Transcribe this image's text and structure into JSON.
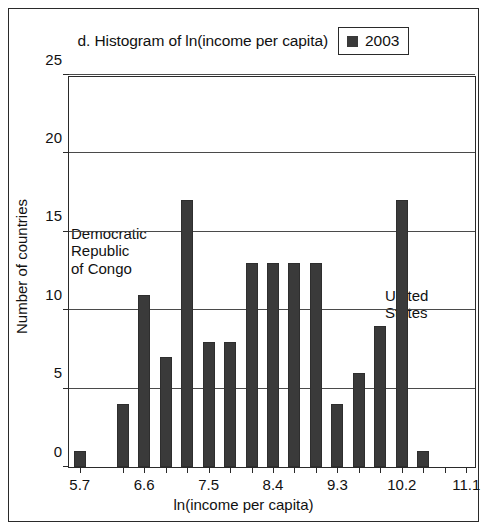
{
  "figure": {
    "title": "d. Histogram of ln(income per capita)",
    "legend": {
      "label": "2003",
      "swatch_color": "#3a3a3a",
      "position": "top-right-of-title"
    }
  },
  "axes": {
    "xlabel": "ln(income per capita)",
    "ylabel": "Number of countries",
    "y_ticks": [
      0,
      5,
      10,
      15,
      20,
      25
    ],
    "x_ticks": [
      "5.7",
      "6.6",
      "7.5",
      "8.4",
      "9.3",
      "10.2",
      "11.1"
    ]
  },
  "annotations": [
    {
      "id": "congo",
      "lines": [
        "Democratic",
        "Republic",
        "of Congo"
      ]
    },
    {
      "id": "us",
      "lines": [
        "United",
        "States"
      ]
    }
  ],
  "colors": {
    "bar": "#3a3a3a",
    "frame": "#2a2a2a",
    "grid": "#4a4a4a",
    "background": "#ffffff"
  },
  "chart_data": {
    "type": "bar",
    "title": "d. Histogram of ln(income per capita)",
    "xlabel": "ln(income per capita)",
    "ylabel": "Number of countries",
    "ylim": [
      0,
      25
    ],
    "xlim": [
      5.55,
      11.25
    ],
    "grid": true,
    "legend": [
      "2003"
    ],
    "legend_position": "top-right",
    "x_tick_labels": [
      "5.7",
      "6.6",
      "7.5",
      "8.4",
      "9.3",
      "10.2",
      "11.1"
    ],
    "x_tick_values": [
      5.7,
      6.6,
      7.5,
      8.4,
      9.3,
      10.2,
      11.1
    ],
    "y_tick_values": [
      0,
      5,
      10,
      15,
      20,
      25
    ],
    "bin_width": 0.3,
    "bin_centers": [
      5.7,
      6.3,
      6.6,
      6.9,
      7.2,
      7.5,
      7.8,
      8.1,
      8.4,
      8.7,
      9.0,
      9.3,
      9.6,
      9.9,
      10.2,
      10.5
    ],
    "values": [
      1,
      4,
      11,
      7,
      17,
      8,
      8,
      13,
      13,
      13,
      13,
      4,
      6,
      9,
      17,
      1
    ],
    "series": [
      {
        "name": "2003",
        "values": [
          1,
          4,
          11,
          7,
          17,
          8,
          8,
          13,
          13,
          13,
          13,
          4,
          6,
          9,
          17,
          1
        ]
      }
    ],
    "annotations": [
      {
        "text": "Democratic Republic of Congo",
        "points_to_bin_center": 5.7,
        "value": 1
      },
      {
        "text": "United States",
        "points_to_bin_center": 10.5,
        "value": 1
      }
    ]
  }
}
